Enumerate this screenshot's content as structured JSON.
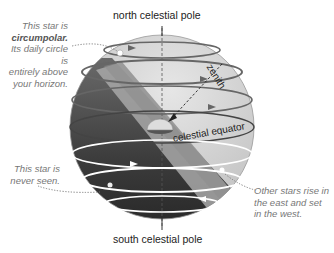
{
  "diagram": {
    "labels": {
      "north_pole": "north celestial pole",
      "south_pole": "south celestial pole",
      "zenith": "zenith",
      "equator": "celestial equator"
    },
    "notes": {
      "circumpolar": {
        "line1": "This star is",
        "line2_bold": "circumpolar.",
        "line3": "Its daily circle is",
        "line4": "entirely above",
        "line5": "your horizon."
      },
      "never_seen": {
        "line1": "This star is",
        "line2": "never seen."
      },
      "rise_set": {
        "line1": "Other stars rise in",
        "line2": "the east and set",
        "line3": "in the west."
      }
    },
    "colors": {
      "sky_light": "#d6d6d6",
      "sky_dark": "#3a3a3a",
      "horizon_plane": "#b0b0b0",
      "star_path_upper": "#6a6a6a",
      "star_path_lower": "#ffffff",
      "note_text": "#777777"
    }
  }
}
